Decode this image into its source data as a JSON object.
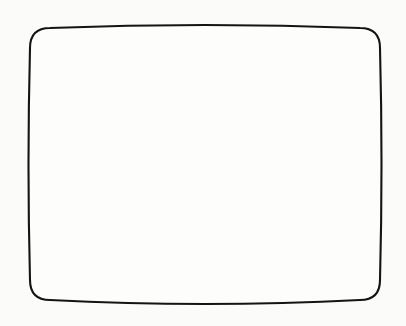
{
  "figure": {
    "style": "pen-and-ink line drawing",
    "canvas": {
      "width": 406,
      "height": 326,
      "background_color": "#fbfbfa"
    },
    "outline": {
      "stroke_color": "#141414",
      "fill_color": "#fdfdfc",
      "stroke_width": 2.1,
      "corner_radius": 20,
      "bounds": {
        "left": 30,
        "top": 28,
        "right": 380,
        "bottom": 300
      },
      "edge_bulge": {
        "top": -6,
        "bottom": 8,
        "left": -3,
        "right": 3
      }
    },
    "hatching": {
      "orientation": "horizontal",
      "stroke_color": "#1a1a1a",
      "line_count": 31,
      "average_spacing": 8.6,
      "slope_direction": "down-to-the-right",
      "average_slope_px": 13,
      "lines": [
        {
          "y": 36,
          "slope": 10,
          "width": 1.5
        },
        {
          "y": 45,
          "slope": 12,
          "width": 1.7
        },
        {
          "y": 53,
          "slope": 11,
          "width": 1.4
        },
        {
          "y": 62,
          "slope": 13,
          "width": 1.8
        },
        {
          "y": 70,
          "slope": 12,
          "width": 1.5
        },
        {
          "y": 79,
          "slope": 14,
          "width": 1.6
        },
        {
          "y": 88,
          "slope": 13,
          "width": 1.4
        },
        {
          "y": 97,
          "slope": 12,
          "width": 1.8
        },
        {
          "y": 105,
          "slope": 14,
          "width": 1.5
        },
        {
          "y": 113,
          "slope": 13,
          "width": 1.6
        },
        {
          "y": 122,
          "slope": 12,
          "width": 1.4
        },
        {
          "y": 130,
          "slope": 14,
          "width": 1.7
        },
        {
          "y": 139,
          "slope": 13,
          "width": 1.5
        },
        {
          "y": 147,
          "slope": 12,
          "width": 1.6
        },
        {
          "y": 156,
          "slope": 14,
          "width": 1.8
        },
        {
          "y": 164,
          "slope": 13,
          "width": 1.4
        },
        {
          "y": 172,
          "slope": 12,
          "width": 1.6
        },
        {
          "y": 181,
          "slope": 14,
          "width": 1.5
        },
        {
          "y": 189,
          "slope": 13,
          "width": 1.7
        },
        {
          "y": 198,
          "slope": 12,
          "width": 1.5
        },
        {
          "y": 206,
          "slope": 14,
          "width": 1.6
        },
        {
          "y": 215,
          "slope": 13,
          "width": 1.8
        },
        {
          "y": 223,
          "slope": 12,
          "width": 1.4
        },
        {
          "y": 232,
          "slope": 14,
          "width": 1.6
        },
        {
          "y": 240,
          "slope": 13,
          "width": 1.5
        },
        {
          "y": 249,
          "slope": 12,
          "width": 1.7
        },
        {
          "y": 257,
          "slope": 14,
          "width": 1.5
        },
        {
          "y": 265,
          "slope": 13,
          "width": 1.6
        },
        {
          "y": 274,
          "slope": 12,
          "width": 1.8
        },
        {
          "y": 282,
          "slope": 11,
          "width": 1.5
        },
        {
          "y": 291,
          "slope": 9,
          "width": 1.6
        }
      ]
    }
  }
}
